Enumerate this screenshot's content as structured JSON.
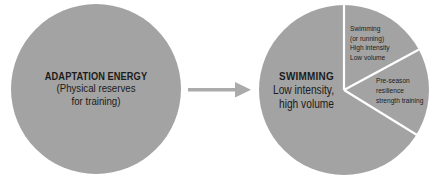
{
  "colors": {
    "background": "#ffffff",
    "circle_fill": "#a3a3a3",
    "divider": "#ffffff",
    "arrow": "#ababab",
    "text": "#1c1c1c"
  },
  "left_circle": {
    "title": "ADAPTATION ENERGY",
    "subtitle_lines": [
      "(Physical reserves",
      "for training)"
    ]
  },
  "arrow": {
    "direction": "right"
  },
  "right_circle": {
    "main_slice": {
      "title": "SWIMMING",
      "subtitle_lines": [
        "Low intensity,",
        "high volume"
      ]
    },
    "top_slice": {
      "lines": [
        "Swimming",
        "(or running)",
        "High intensity",
        "Low volume"
      ]
    },
    "middle_slice": {
      "lines": [
        "Pre-season",
        "resilience",
        "strength training"
      ]
    }
  }
}
